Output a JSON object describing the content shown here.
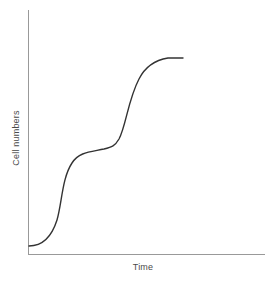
{
  "figure": {
    "background_color": "#ffffff",
    "width": 274,
    "height": 285
  },
  "axes": {
    "color": "#999999",
    "line_width": 1,
    "x_axis": {
      "name": "x-axis-line",
      "x1": 28,
      "y1": 254,
      "x2": 265,
      "y2": 254
    },
    "y_axis": {
      "name": "y-axis-line",
      "x1": 28,
      "y1": 10,
      "x2": 28,
      "y2": 254
    }
  },
  "labels": {
    "x": "Time",
    "y": "Cell numbers"
  },
  "chart_data": {
    "type": "line",
    "title": "",
    "xlabel": "Time",
    "ylabel": "Cell numbers",
    "grid": false,
    "legend": "none",
    "series": [
      {
        "name": "Cell numbers over time",
        "color": "#333333",
        "line_width": 1.4,
        "description": "Biphasic (double sigmoid) growth curve: lag, first exponential rise, intermediate plateau, second exponential rise, final plateau",
        "points": [
          [
            29,
            246
          ],
          [
            34,
            245
          ],
          [
            39,
            243
          ],
          [
            44,
            239
          ],
          [
            49,
            233
          ],
          [
            54,
            225
          ],
          [
            58,
            214
          ],
          [
            62,
            199
          ],
          [
            65,
            186
          ],
          [
            68,
            173
          ],
          [
            71,
            164
          ],
          [
            74,
            158
          ],
          [
            78,
            154
          ],
          [
            83,
            152
          ],
          [
            89,
            151
          ],
          [
            96,
            150
          ],
          [
            103,
            149
          ],
          [
            110,
            147
          ],
          [
            115,
            144
          ],
          [
            119,
            139
          ],
          [
            123,
            131
          ],
          [
            127,
            119
          ],
          [
            131,
            104
          ],
          [
            135,
            90
          ],
          [
            139,
            79
          ],
          [
            143,
            72
          ],
          [
            148,
            66
          ],
          [
            153,
            62
          ],
          [
            159,
            60
          ],
          [
            166,
            58
          ],
          [
            174,
            58
          ],
          [
            183,
            58
          ]
        ],
        "path_d": "M 29 246 C 38 246, 50 242, 57 220 C 62 203, 62 178, 72 163 C 79 152, 90 152, 104 149 C 112 147, 115 146, 119 139 C 126 126, 128 100, 139 79 C 145 67, 156 60, 168 58 L 183 58"
      }
    ],
    "axis_ranges": {
      "x_start_px": 28,
      "x_end_px": 265,
      "y_bottom_px": 254,
      "y_top_px": 10
    }
  }
}
